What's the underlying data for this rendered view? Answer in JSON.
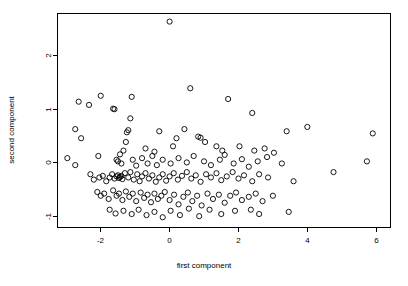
{
  "chart_data": {
    "type": "scatter",
    "title": "",
    "xlabel": "first component",
    "ylabel": "second component",
    "xlim": [
      -3.25,
      6.45
    ],
    "ylim": [
      -1.22,
      2.78
    ],
    "xticks": [
      -2,
      0,
      2,
      4,
      6
    ],
    "xtick_labels": [
      "-2",
      "0",
      "2",
      "4",
      "6"
    ],
    "yticks": [
      -1,
      0,
      1,
      2
    ],
    "ytick_labels": [
      "-1",
      "0",
      "1",
      "2"
    ],
    "grid": false,
    "legend": null,
    "marker": {
      "shape": "open-circle",
      "radius_px": 2.6,
      "stroke": "#000000",
      "fill": "none",
      "stroke_width": 0.9
    },
    "frame": {
      "box": true,
      "stroke": "#000000"
    },
    "background": "#ffffff",
    "n_points": 168,
    "points": [
      [
        0.02,
        2.62
      ],
      [
        -2.62,
        1.13
      ],
      [
        -2.32,
        1.07
      ],
      [
        -1.98,
        1.24
      ],
      [
        -1.62,
        1.0
      ],
      [
        -1.58,
        0.99
      ],
      [
        -1.08,
        1.22
      ],
      [
        -1.12,
        0.82
      ],
      [
        0.62,
        1.38
      ],
      [
        1.72,
        1.18
      ],
      [
        -2.72,
        0.62
      ],
      [
        -2.55,
        0.45
      ],
      [
        -1.18,
        0.6
      ],
      [
        -1.22,
        0.56
      ],
      [
        -0.28,
        0.58
      ],
      [
        0.22,
        0.45
      ],
      [
        0.45,
        0.62
      ],
      [
        2.42,
        0.92
      ],
      [
        3.42,
        0.58
      ],
      [
        4.02,
        0.66
      ],
      [
        -1.25,
        0.38
      ],
      [
        -1.32,
        0.22
      ],
      [
        -0.68,
        0.26
      ],
      [
        -0.42,
        0.2
      ],
      [
        0.12,
        0.3
      ],
      [
        0.85,
        0.48
      ],
      [
        0.92,
        0.46
      ],
      [
        1.05,
        0.38
      ],
      [
        1.38,
        0.3
      ],
      [
        1.55,
        0.22
      ],
      [
        2.05,
        0.3
      ],
      [
        2.48,
        0.22
      ],
      [
        2.78,
        0.26
      ],
      [
        3.05,
        0.18
      ],
      [
        5.92,
        0.54
      ],
      [
        -2.95,
        0.08
      ],
      [
        -2.72,
        -0.05
      ],
      [
        -2.05,
        0.12
      ],
      [
        -1.52,
        0.05
      ],
      [
        -1.48,
        0.02
      ],
      [
        -1.42,
        0.15
      ],
      [
        -1.38,
        -0.02
      ],
      [
        -1.05,
        0.05
      ],
      [
        -0.95,
        -0.06
      ],
      [
        -0.78,
        0.08
      ],
      [
        -0.62,
        -0.02
      ],
      [
        -0.48,
        0.12
      ],
      [
        -0.35,
        -0.05
      ],
      [
        -0.18,
        0.05
      ],
      [
        0.05,
        -0.02
      ],
      [
        0.28,
        0.08
      ],
      [
        0.52,
        0.0
      ],
      [
        0.72,
        0.12
      ],
      [
        1.02,
        0.02
      ],
      [
        1.22,
        -0.05
      ],
      [
        1.48,
        0.05
      ],
      [
        1.62,
        0.14
      ],
      [
        1.88,
        -0.02
      ],
      [
        2.12,
        0.06
      ],
      [
        2.32,
        -0.08
      ],
      [
        2.58,
        0.02
      ],
      [
        2.85,
        0.1
      ],
      [
        3.28,
        -0.02
      ],
      [
        5.75,
        0.02
      ],
      [
        -2.28,
        -0.22
      ],
      [
        -2.18,
        -0.32
      ],
      [
        -2.02,
        -0.28
      ],
      [
        -1.92,
        -0.25
      ],
      [
        -1.82,
        -0.35
      ],
      [
        -1.72,
        -0.28
      ],
      [
        -1.65,
        -0.22
      ],
      [
        -1.58,
        -0.3
      ],
      [
        -1.52,
        -0.26
      ],
      [
        -1.48,
        -0.24
      ],
      [
        -1.45,
        -0.29
      ],
      [
        -1.42,
        -0.27
      ],
      [
        -1.38,
        -0.25
      ],
      [
        -1.35,
        -0.31
      ],
      [
        -1.28,
        -0.2
      ],
      [
        -1.18,
        -0.28
      ],
      [
        -1.12,
        -0.18
      ],
      [
        -1.02,
        -0.32
      ],
      [
        -0.92,
        -0.22
      ],
      [
        -0.85,
        -0.35
      ],
      [
        -0.78,
        -0.26
      ],
      [
        -0.68,
        -0.2
      ],
      [
        -0.58,
        -0.3
      ],
      [
        -0.48,
        -0.24
      ],
      [
        -0.38,
        -0.36
      ],
      [
        -0.28,
        -0.28
      ],
      [
        -0.18,
        -0.22
      ],
      [
        -0.08,
        -0.34
      ],
      [
        0.02,
        -0.26
      ],
      [
        0.14,
        -0.2
      ],
      [
        0.26,
        -0.32
      ],
      [
        0.38,
        -0.25
      ],
      [
        0.52,
        -0.18
      ],
      [
        0.65,
        -0.3
      ],
      [
        0.78,
        -0.24
      ],
      [
        0.92,
        -0.36
      ],
      [
        1.08,
        -0.22
      ],
      [
        1.22,
        -0.28
      ],
      [
        1.38,
        -0.2
      ],
      [
        1.52,
        -0.33
      ],
      [
        1.68,
        -0.26
      ],
      [
        1.85,
        -0.18
      ],
      [
        2.02,
        -0.3
      ],
      [
        2.18,
        -0.24
      ],
      [
        2.42,
        -0.35
      ],
      [
        2.62,
        -0.22
      ],
      [
        2.88,
        -0.28
      ],
      [
        3.62,
        -0.35
      ],
      [
        4.78,
        -0.18
      ],
      [
        -2.08,
        -0.55
      ],
      [
        -1.98,
        -0.62
      ],
      [
        -1.88,
        -0.58
      ],
      [
        -1.75,
        -0.68
      ],
      [
        -1.62,
        -0.52
      ],
      [
        -1.52,
        -0.62
      ],
      [
        -1.45,
        -0.58
      ],
      [
        -1.35,
        -0.7
      ],
      [
        -1.25,
        -0.54
      ],
      [
        -1.15,
        -0.64
      ],
      [
        -1.05,
        -0.58
      ],
      [
        -0.95,
        -0.72
      ],
      [
        -0.82,
        -0.56
      ],
      [
        -0.72,
        -0.66
      ],
      [
        -0.62,
        -0.6
      ],
      [
        -0.52,
        -0.74
      ],
      [
        -0.42,
        -0.58
      ],
      [
        -0.32,
        -0.68
      ],
      [
        -0.22,
        -0.62
      ],
      [
        -0.12,
        -0.55
      ],
      [
        0.02,
        -0.7
      ],
      [
        0.15,
        -0.6
      ],
      [
        0.28,
        -0.78
      ],
      [
        0.42,
        -0.64
      ],
      [
        0.55,
        -0.56
      ],
      [
        0.68,
        -0.72
      ],
      [
        0.82,
        -0.62
      ],
      [
        0.95,
        -0.8
      ],
      [
        1.12,
        -0.58
      ],
      [
        1.28,
        -0.68
      ],
      [
        1.45,
        -0.6
      ],
      [
        1.62,
        -0.75
      ],
      [
        1.78,
        -0.62
      ],
      [
        1.95,
        -0.56
      ],
      [
        2.12,
        -0.7
      ],
      [
        2.32,
        -0.64
      ],
      [
        2.52,
        -0.58
      ],
      [
        2.72,
        -0.72
      ],
      [
        3.02,
        -0.62
      ],
      [
        -1.72,
        -0.88
      ],
      [
        -1.55,
        -0.95
      ],
      [
        -1.32,
        -0.9
      ],
      [
        -1.08,
        -0.96
      ],
      [
        -0.88,
        -0.88
      ],
      [
        -0.65,
        -0.98
      ],
      [
        -0.42,
        -0.92
      ],
      [
        -0.18,
        -1.02
      ],
      [
        0.05,
        -0.9
      ],
      [
        0.32,
        -0.98
      ],
      [
        0.58,
        -0.86
      ],
      [
        0.88,
        -1.0
      ],
      [
        1.18,
        -0.88
      ],
      [
        1.52,
        -0.96
      ],
      [
        1.92,
        -0.9
      ],
      [
        2.38,
        -0.88
      ],
      [
        2.62,
        -0.96
      ],
      [
        3.48,
        -0.92
      ]
    ]
  }
}
